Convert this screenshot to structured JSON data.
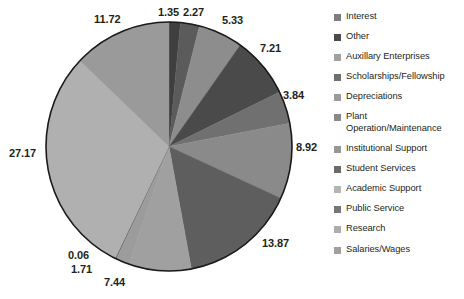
{
  "chart_data": {
    "type": "pie",
    "title": "",
    "subtitle": "",
    "xlabel": "",
    "ylabel": "",
    "grid": false,
    "legend_position": "right",
    "start_angle_deg": 0,
    "direction": "clockwise",
    "units": "percent",
    "categories": [
      "Interest",
      "Other",
      "Auxillary Enterprises",
      "Scholarships/Fellowship",
      "Depreciations",
      "Plant Operation/Maintenance",
      "Institutional Support",
      "Student Services",
      "Academic Support",
      "Public Service",
      "Research",
      "Salaries/Wages"
    ],
    "values": [
      1.35,
      2.27,
      5.33,
      7.21,
      3.84,
      8.92,
      13.87,
      7.44,
      1.71,
      0.06,
      27.17,
      11.72
    ],
    "data_labels": [
      "1.35",
      "2.27",
      "5.33",
      "7.21",
      "3.84",
      "8.92",
      "13.87",
      "7.44",
      "1.71",
      "0.06",
      "27.17",
      "11.72"
    ],
    "colors": [
      "#3f3f3f",
      "#5b5b5b",
      "#8d8d8d",
      "#4a4a4a",
      "#707070",
      "#8a8a8a",
      "#5e5e5e",
      "#a0a0a0",
      "#9c9c9c",
      "#3b3b3b",
      "#b0b0b0",
      "#9a9a9a"
    ],
    "slice_outline": "#1a1a1a"
  },
  "legend": {
    "items": [
      {
        "label": "Interest",
        "color": "#7d7d7d"
      },
      {
        "label": "Other",
        "color": "#4a4a4a"
      },
      {
        "label": "Auxillary Enterprises",
        "color": "#a0a0a0"
      },
      {
        "label": "Scholarships/Fellowship",
        "color": "#6f6f6f"
      },
      {
        "label": "Depreciations",
        "color": "#9a9a9a"
      },
      {
        "label": "Plant Operation/Maintenance",
        "color": "#8a8a8a"
      },
      {
        "label": "Institutional Support",
        "color": "#969696"
      },
      {
        "label": "Student Services",
        "color": "#6a6a6a"
      },
      {
        "label": "Academic Support",
        "color": "#b4b4b4"
      },
      {
        "label": "Public Service",
        "color": "#767676"
      },
      {
        "label": "Research",
        "color": "#adadad"
      },
      {
        "label": "Salaries/Wages",
        "color": "#9f9f9f"
      }
    ]
  },
  "labels_layout": [
    {
      "text": "1.35",
      "left": 158,
      "top": 6
    },
    {
      "text": "2.27",
      "left": 183,
      "top": 6
    },
    {
      "text": "5.33",
      "left": 222,
      "top": 14
    },
    {
      "text": "7.21",
      "left": 260,
      "top": 42
    },
    {
      "text": "3.84",
      "left": 283,
      "top": 89
    },
    {
      "text": "8.92",
      "left": 296,
      "top": 141
    },
    {
      "text": "13.87",
      "left": 262,
      "top": 237
    },
    {
      "text": "7.44",
      "left": 104,
      "top": 276
    },
    {
      "text": "1.71",
      "left": 71,
      "top": 263
    },
    {
      "text": "0.06",
      "left": 68,
      "top": 249
    },
    {
      "text": "27.17",
      "left": 9,
      "top": 147
    },
    {
      "text": "11.72",
      "left": 94,
      "top": 13
    }
  ]
}
